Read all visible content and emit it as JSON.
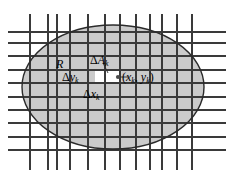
{
  "figure": {
    "kind": "math-diagram",
    "colors": {
      "background": "#ffffff",
      "region_fill": "#c8c8c8",
      "highlight_cell_fill": "#ffffff",
      "grid_line": "#3a3a3a",
      "grid_line_light": "#8e8e8e",
      "boundary_curve": "#2b2b2b",
      "text": "#000000"
    },
    "labels": {
      "region": "R",
      "area_element_delta": "Δ",
      "area_element_symbol": "A",
      "area_element_sub": "k",
      "delta_y_delta": "Δ",
      "delta_y_symbol": "y",
      "delta_y_sub": "k",
      "delta_x_delta": "Δ",
      "delta_x_symbol": "x",
      "delta_x_sub": "k",
      "point_open": "(",
      "point_x": "x",
      "point_x_sub": "k",
      "point_comma": ", ",
      "point_y": "y",
      "point_y_sub": "k",
      "point_close": ")"
    },
    "geometry": {
      "ellipse_center_x": 113,
      "ellipse_center_y": 87,
      "ellipse_radius_x": 91,
      "ellipse_radius_y": 62,
      "vertical_grid_x": [
        30,
        48,
        57,
        70,
        88,
        105,
        120,
        136,
        150,
        162,
        177,
        192
      ],
      "horizontal_grid_y": [
        32,
        43,
        56,
        70,
        83,
        97,
        110,
        123,
        137,
        150
      ],
      "highlight_cell": {
        "x": 95,
        "y": 70,
        "width": 25,
        "height": 13
      },
      "sample_point": {
        "x": 118,
        "y": 77
      }
    }
  }
}
